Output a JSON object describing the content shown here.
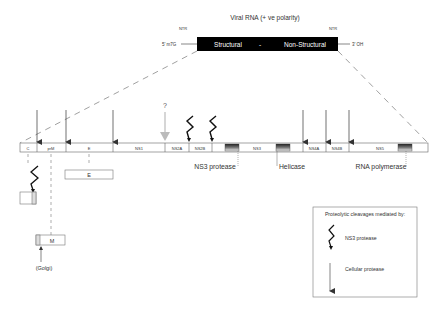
{
  "genome": {
    "title": "Viral RNA (+ ve polarity)",
    "ntr_left": "NTR",
    "ntr_right": "NTR",
    "five_prime": "5' m7G",
    "three_prime": "3' OH",
    "structural": "Structural",
    "separator": "-",
    "non_structural": "Non-Structural"
  },
  "polyprotein": {
    "segments": [
      {
        "label": "C"
      },
      {
        "label": "prM"
      },
      {
        "label": "E"
      },
      {
        "label": "NS1"
      },
      {
        "label": "NS2A"
      },
      {
        "label": "NS2B"
      },
      {
        "label": "NS3"
      },
      {
        "label": "NS4A"
      },
      {
        "label": "NS4B"
      },
      {
        "label": "NS5"
      }
    ],
    "question_mark": "?",
    "domains": {
      "ns3_protease": "NS3 protease",
      "helicase": "Helicase",
      "rna_polymerase": "RNA polymerase"
    }
  },
  "products": {
    "e_box": "E",
    "m_box": "M",
    "golgi": "(Golgi)"
  },
  "legend": {
    "title": "Proteolytic cleavages mediated by:",
    "ns3_protease": "NS3 protease",
    "cellular_protease": "Cellular protease"
  },
  "colors": {
    "genome_box": "#000000",
    "line": "#555555",
    "unknown_arrow": "#bbbbbb"
  }
}
